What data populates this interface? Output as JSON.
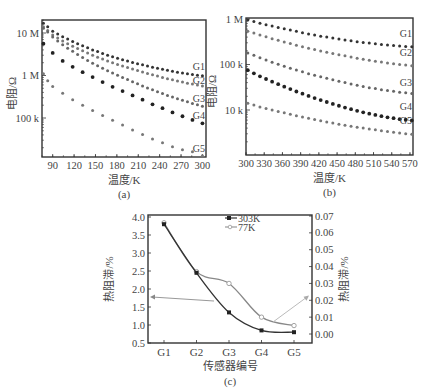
{
  "chart_data": [
    {
      "id": "a",
      "type": "scatter",
      "caption": "(a)",
      "xlabel": "温度/K",
      "ylabel": "电阻/Ω",
      "yscale": "log",
      "xlim": [
        75,
        305
      ],
      "ylim": [
        15000,
        20000000
      ],
      "xticks": [
        90,
        120,
        150,
        180,
        210,
        240,
        270,
        300
      ],
      "yticks": [
        {
          "value": 10000000,
          "label": "10 M"
        },
        {
          "value": 1000000,
          "label": "1 M"
        },
        {
          "value": 100000,
          "label": "100 k"
        }
      ],
      "series": [
        {
          "name": "G1",
          "x": [
            77,
            83,
            90,
            97,
            104,
            111,
            118,
            125,
            132,
            139,
            146,
            153,
            160,
            167,
            174,
            181,
            188,
            195,
            202,
            209,
            216,
            223,
            230,
            237,
            244,
            251,
            258,
            265,
            272,
            279,
            286,
            293,
            300
          ],
          "y": [
            17000000,
            14000000,
            11000000,
            9500000,
            8200000,
            7200000,
            6300000,
            5600000,
            5000000,
            4500000,
            4000000,
            3650000,
            3300000,
            3000000,
            2750000,
            2550000,
            2350000,
            2180000,
            2030000,
            1900000,
            1780000,
            1670000,
            1570000,
            1480000,
            1400000,
            1330000,
            1260000,
            1200000,
            1150000,
            1100000,
            1060000,
            1020000,
            990000
          ]
        },
        {
          "name": "G2",
          "x": [
            77,
            83,
            90,
            97,
            104,
            111,
            118,
            125,
            132,
            139,
            146,
            153,
            160,
            167,
            174,
            181,
            188,
            195,
            202,
            209,
            216,
            223,
            230,
            237,
            244,
            251,
            258,
            265,
            272,
            279,
            286,
            293,
            300
          ],
          "y": [
            14000000,
            11500000,
            9000000,
            7600000,
            6500000,
            5600000,
            4900000,
            4300000,
            3800000,
            3400000,
            3000000,
            2700000,
            2450000,
            2200000,
            2000000,
            1820000,
            1670000,
            1540000,
            1420000,
            1310000,
            1210000,
            1120000,
            1040000,
            970000,
            900000,
            840000,
            790000,
            740000,
            700000,
            660000,
            630000,
            600000,
            570000
          ]
        },
        {
          "name": "G3",
          "x": [
            77,
            83,
            90,
            97,
            104,
            111,
            118,
            125,
            132,
            139,
            146,
            153,
            160,
            167,
            174,
            181,
            188,
            195,
            202,
            209,
            216,
            223,
            230,
            237,
            244,
            251,
            258,
            265,
            272,
            279,
            286,
            293,
            300
          ],
          "y": [
            13000000,
            10500000,
            8000000,
            6500000,
            5300000,
            4400000,
            3700000,
            3100000,
            2650000,
            2250000,
            1950000,
            1700000,
            1480000,
            1300000,
            1150000,
            1020000,
            900000,
            800000,
            710000,
            640000,
            570000,
            510000,
            460000,
            415000,
            375000,
            340000,
            310000,
            285000,
            260000,
            240000,
            220000,
            205000,
            190000
          ]
        },
        {
          "name": "G4",
          "x": [
            77,
            90,
            104,
            118,
            132,
            146,
            160,
            174,
            188,
            202,
            216,
            230,
            244,
            258,
            272,
            286,
            300
          ],
          "y": [
            5600000,
            3400000,
            2200000,
            1600000,
            1200000,
            920000,
            700000,
            540000,
            430000,
            340000,
            270000,
            210000,
            170000,
            135000,
            110000,
            90000,
            75000
          ]
        },
        {
          "name": "G5",
          "x": [
            77,
            83,
            90,
            104,
            118,
            132,
            146,
            160,
            174,
            188,
            202,
            216,
            230,
            244,
            258,
            272,
            286,
            300
          ],
          "y": [
            1100000,
            750000,
            550000,
            380000,
            270000,
            200000,
            150000,
            115000,
            88000,
            68000,
            52000,
            41000,
            32000,
            26000,
            21000,
            18000,
            16000,
            13000
          ]
        }
      ]
    },
    {
      "id": "b",
      "type": "scatter",
      "caption": "(b)",
      "xlabel": "温度/K",
      "ylabel": "电阻/Ω",
      "yscale": "log",
      "xlim": [
        300,
        575
      ],
      "ylim": [
        1000,
        1050000
      ],
      "xticks": [
        300,
        330,
        360,
        390,
        420,
        450,
        480,
        510,
        540,
        570
      ],
      "yticks": [
        {
          "value": 1000000,
          "label": "1 M"
        },
        {
          "value": 100000,
          "label": "100 k"
        },
        {
          "value": 10000,
          "label": "10 k"
        }
      ],
      "series": [
        {
          "name": "G1",
          "x": [
            303,
            313,
            323,
            333,
            343,
            353,
            363,
            373,
            383,
            393,
            403,
            413,
            423,
            433,
            443,
            453,
            463,
            473,
            483,
            493,
            503,
            513,
            523,
            533,
            543,
            553,
            563,
            573
          ],
          "y": [
            950000,
            880000,
            810000,
            750000,
            700000,
            650000,
            610000,
            570000,
            535000,
            500000,
            470000,
            445000,
            420000,
            400000,
            380000,
            362000,
            346000,
            332000,
            318000,
            306000,
            295000,
            285000,
            276000,
            268000,
            261000,
            255000,
            250000,
            245000
          ]
        },
        {
          "name": "G2",
          "x": [
            303,
            313,
            323,
            333,
            343,
            353,
            363,
            373,
            383,
            393,
            403,
            413,
            423,
            433,
            443,
            453,
            463,
            473,
            483,
            493,
            503,
            513,
            523,
            533,
            543,
            553,
            563,
            573
          ],
          "y": [
            540000,
            490000,
            445000,
            405000,
            370000,
            340000,
            312000,
            288000,
            266000,
            246000,
            229000,
            213000,
            199000,
            186000,
            175000,
            164000,
            155000,
            146000,
            138000,
            131000,
            124000,
            118000,
            113000,
            108000,
            104000,
            100000,
            97000,
            94000
          ]
        },
        {
          "name": "G3",
          "x": [
            303,
            313,
            323,
            333,
            343,
            353,
            363,
            373,
            383,
            393,
            403,
            413,
            423,
            433,
            443,
            453,
            463,
            473,
            483,
            493,
            503,
            513,
            523,
            533,
            543,
            553,
            563,
            573
          ],
          "y": [
            180000,
            160000,
            140000,
            125000,
            112000,
            101000,
            91000,
            83000,
            76000,
            69000,
            63000,
            58000,
            54000,
            50000,
            46000,
            43000,
            40000,
            37500,
            35000,
            33000,
            31000,
            29500,
            28000,
            26800,
            25700,
            24700,
            23800,
            23000
          ]
        },
        {
          "name": "G4",
          "x": [
            303,
            313,
            323,
            333,
            343,
            353,
            363,
            373,
            383,
            393,
            403,
            413,
            423,
            433,
            443,
            453,
            463,
            473,
            483,
            493,
            503,
            513,
            523,
            533,
            543,
            553,
            563,
            573
          ],
          "y": [
            75000,
            64000,
            55000,
            48000,
            42000,
            37000,
            32500,
            28800,
            25500,
            22800,
            20400,
            18300,
            16500,
            15000,
            13600,
            12400,
            11300,
            10400,
            9600,
            8900,
            8300,
            7800,
            7300,
            6900,
            6600,
            6300,
            6100,
            5900
          ]
        },
        {
          "name": "G5",
          "x": [
            303,
            313,
            323,
            333,
            343,
            353,
            363,
            373,
            383,
            393,
            403,
            413,
            423,
            433,
            443,
            453,
            463,
            473,
            483,
            493,
            503,
            513,
            523,
            533,
            543,
            553,
            563,
            573
          ],
          "y": [
            14000,
            12800,
            11700,
            10800,
            10000,
            9300,
            8650,
            8050,
            7500,
            7000,
            6550,
            6150,
            5800,
            5450,
            5150,
            4880,
            4630,
            4400,
            4190,
            4000,
            3830,
            3670,
            3520,
            3380,
            3250,
            3130,
            3020,
            2920
          ]
        }
      ]
    },
    {
      "id": "c",
      "type": "line",
      "caption": "(c)",
      "xlabel": "传感器编号",
      "ylabel": "热阻滞/%",
      "ylabel_right": "热阻滞/%",
      "categories": [
        "G1",
        "G2",
        "G3",
        "G4",
        "G5"
      ],
      "ylim": [
        0.5,
        4.0
      ],
      "ylim_right": [
        -0.005,
        0.07
      ],
      "yticks": [
        0.5,
        1.0,
        1.5,
        2.0,
        2.5,
        3.0,
        3.5,
        4.0
      ],
      "yticks_right": [
        0.0,
        0.01,
        0.02,
        0.03,
        0.04,
        0.05,
        0.06,
        0.07
      ],
      "legend_position": "top-center",
      "series": [
        {
          "name": "303K",
          "axis": "left",
          "marker": "filled-square",
          "values": [
            3.8,
            2.45,
            1.35,
            0.85,
            0.8
          ]
        },
        {
          "name": "77K",
          "axis": "right",
          "marker": "open-circle",
          "values": [
            0.066,
            0.037,
            0.03,
            0.01,
            0.005
          ]
        }
      ],
      "annotations": [
        {
          "type": "arrow",
          "description": "arrow from 303K curve pointing to left axis"
        },
        {
          "type": "arrow",
          "description": "arrow from 77K curve pointing to right axis"
        }
      ]
    }
  ]
}
